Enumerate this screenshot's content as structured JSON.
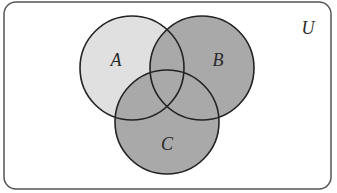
{
  "diagram": {
    "type": "venn",
    "universe": {
      "label": "U",
      "x": 4,
      "y": 2,
      "width": 327,
      "height": 187,
      "corner_radius": 12,
      "stroke": "#555555",
      "fill": "#ffffff"
    },
    "sets": [
      {
        "label": "A",
        "cx": 132,
        "cy": 68,
        "r": 52,
        "label_x": 116,
        "label_y": 66
      },
      {
        "label": "B",
        "cx": 202,
        "cy": 68,
        "r": 52,
        "label_x": 218,
        "label_y": 66
      },
      {
        "label": "C",
        "cx": 167,
        "cy": 122,
        "r": 52,
        "label_x": 167,
        "label_y": 150
      }
    ],
    "shading": {
      "description": "Region B ∪ C shaded dark; A-only region shaded light",
      "light_fill": "#e0e0e0",
      "dark_fill": "#a9a9a9",
      "stroke": "#222222"
    }
  }
}
